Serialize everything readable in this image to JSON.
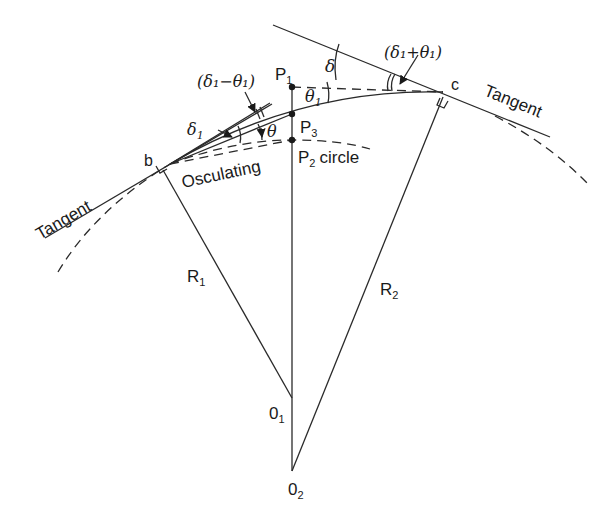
{
  "diagram": {
    "labels": {
      "tangent_left": "Tangent",
      "tangent_right": "Tangent",
      "osculating": "Osculating",
      "p2_circle": "circle",
      "point_b": "b",
      "point_c": "c",
      "P1": "P",
      "P1_sub": "1",
      "P2": "P",
      "P2_sub": "2",
      "P3": "P",
      "P3_sub": "3",
      "R1": "R",
      "R1_sub": "1",
      "R2": "R",
      "R2_sub": "2",
      "O1": "0",
      "O1_sub": "1",
      "O2": "0",
      "O2_sub": "2",
      "delta": "δ",
      "delta1": "δ",
      "delta1_sub": "1",
      "theta": "θ",
      "theta1": "θ",
      "theta1_sub": "1",
      "delta1_minus_theta1": "(δ₁−θ₁)",
      "delta1_plus_theta1": "(δ₁+θ₁)"
    },
    "colors": {
      "line": "#2a2a2a",
      "background": "#ffffff"
    }
  }
}
